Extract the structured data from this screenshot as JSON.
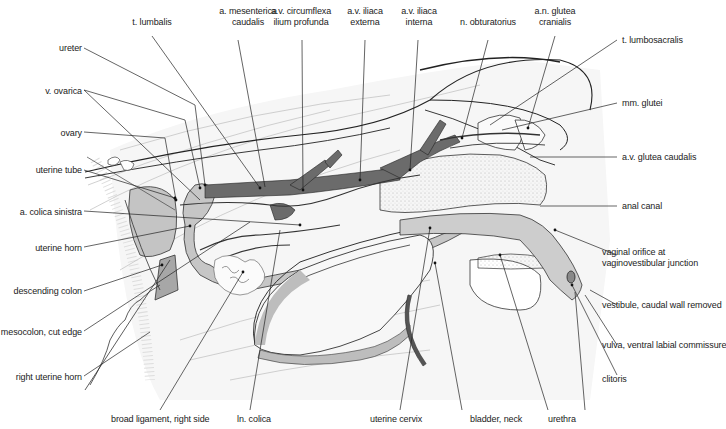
{
  "figure": {
    "type": "anatomical-illustration",
    "colors": {
      "artery_vein": "#6b6b6b",
      "organ_light": "#c8c8c8",
      "organ_mid": "#a9a9a9",
      "line": "#222222",
      "faint": "#bdbdbd"
    }
  },
  "labels": {
    "left": [
      {
        "id": "ureter",
        "text": "ureter"
      },
      {
        "id": "v-ovarica",
        "text": "v. ovarica"
      },
      {
        "id": "ovary",
        "text": "ovary"
      },
      {
        "id": "uterine-tube",
        "text": "uterine tube"
      },
      {
        "id": "a-colica-sinistra",
        "text": "a. colica sinistra"
      },
      {
        "id": "uterine-horn",
        "text": "uterine horn"
      },
      {
        "id": "descending-colon",
        "text": "descending colon"
      },
      {
        "id": "mesocolon-cut-edge",
        "text": "mesocolon, cut edge"
      },
      {
        "id": "right-uterine-horn",
        "text": "right uterine horn"
      }
    ],
    "top": [
      {
        "id": "t-lumbalis",
        "lines": [
          "t. lumbalis"
        ]
      },
      {
        "id": "a-mesenterica-caudalis",
        "lines": [
          "a. mesenterica",
          "caudalis"
        ]
      },
      {
        "id": "av-circumflexa-ilium-profunda",
        "lines": [
          "a.v. circumflexa",
          "ilium profunda"
        ]
      },
      {
        "id": "av-iliaca-externa",
        "lines": [
          "a.v. iliaca",
          "externa"
        ]
      },
      {
        "id": "av-iliaca-interna",
        "lines": [
          "a.v. iliaca",
          "interna"
        ]
      },
      {
        "id": "n-obturatorius",
        "lines": [
          "n. obturatorius"
        ]
      },
      {
        "id": "an-glutea-cranialis",
        "lines": [
          "a.n. glutea",
          "cranialis"
        ]
      }
    ],
    "right": [
      {
        "id": "t-lumbosacralis",
        "lines": [
          "t. lumbosacralis"
        ]
      },
      {
        "id": "mm-glutei",
        "lines": [
          "mm. glutei"
        ]
      },
      {
        "id": "av-glutea-caudalis",
        "lines": [
          "a.v. glutea caudalis"
        ]
      },
      {
        "id": "anal-canal",
        "lines": [
          "anal canal"
        ]
      },
      {
        "id": "vaginal-orifice",
        "lines": [
          "vaginal orifice at",
          "vaginovestibular junction"
        ]
      },
      {
        "id": "vestibule",
        "lines": [
          "vestibule, caudal wall removed"
        ]
      },
      {
        "id": "vulva",
        "lines": [
          "vulva, ventral labial commissure"
        ]
      },
      {
        "id": "clitoris",
        "lines": [
          "clitoris"
        ]
      }
    ],
    "bottom": [
      {
        "id": "broad-ligament",
        "text": "broad ligament, right side"
      },
      {
        "id": "ln-colica",
        "text": "ln. colica"
      },
      {
        "id": "uterine-cervix",
        "text": "uterine cervix"
      },
      {
        "id": "bladder-neck",
        "text": "bladder, neck"
      },
      {
        "id": "urethra",
        "text": "urethra"
      }
    ]
  }
}
